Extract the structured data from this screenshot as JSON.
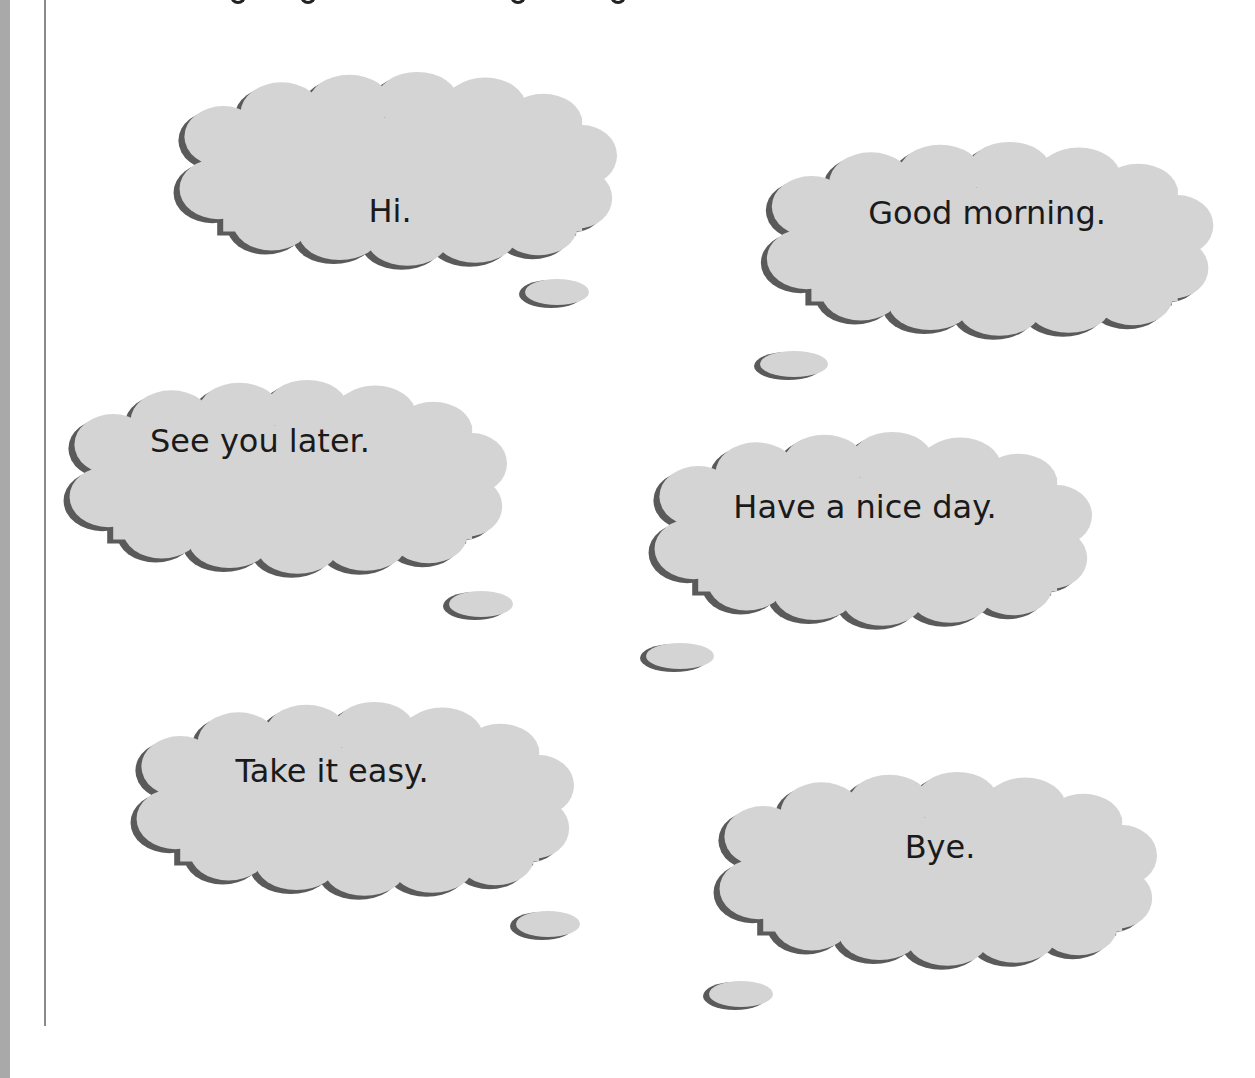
{
  "page": {
    "fill_color": "#d4d4d4",
    "shadow_color": "#5a5a5a",
    "background": "#ffffff"
  },
  "bubbles": [
    {
      "id": "hi",
      "text": "Hi."
    },
    {
      "id": "good-morning",
      "text": "Good morning."
    },
    {
      "id": "see-you-later",
      "text": "See you later."
    },
    {
      "id": "have-a-nice-day",
      "text": "Have a nice day."
    },
    {
      "id": "take-it-easy",
      "text": "Take it easy."
    },
    {
      "id": "bye",
      "text": "Bye."
    }
  ]
}
